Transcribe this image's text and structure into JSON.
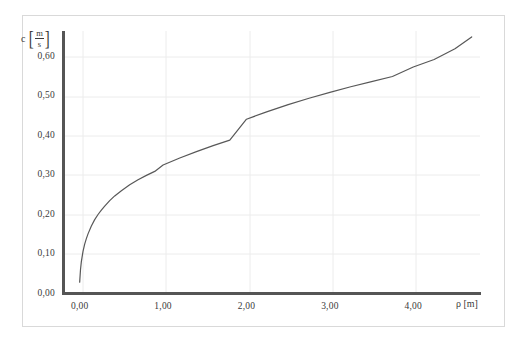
{
  "chart_data": {
    "type": "line",
    "title": "",
    "subtitle": "",
    "xlabel": "ρ [m]",
    "ylabel": "c [m/s]",
    "xlabel_symbol": "ρ",
    "xlabel_unit": "[m]",
    "ylabel_symbol": "c",
    "ylabel_unit_numerator": "m",
    "ylabel_unit_denominator": "s",
    "xlim": [
      -0.2,
      4.8
    ],
    "ylim": [
      0.0,
      0.665
    ],
    "xticks": [
      0,
      1,
      2,
      3,
      4
    ],
    "yticks": [
      0.0,
      0.1,
      0.2,
      0.3,
      0.4,
      0.5,
      0.6
    ],
    "xtick_labels": [
      "0,00",
      "1,00",
      "2,00",
      "3,00",
      "4,00"
    ],
    "ytick_labels": [
      "0,00",
      "0,10",
      "0,20",
      "0,30",
      "0,40",
      "0,50",
      "0,60"
    ],
    "grid": true,
    "grid_color": "#ececec",
    "legend": null,
    "legend_position": "none",
    "series": [
      {
        "name": "c(ρ)",
        "color": "#585858",
        "line_width": 1.2,
        "x": [
          0.0,
          0.01,
          0.02,
          0.04,
          0.06,
          0.08,
          0.1,
          0.14,
          0.18,
          0.22,
          0.26,
          0.3,
          0.36,
          0.42,
          0.5,
          0.6,
          0.7,
          0.8,
          0.9,
          1.0,
          1.2,
          1.4,
          1.6,
          1.8,
          2.0,
          2.25,
          2.5,
          2.75,
          3.0,
          3.25,
          3.5,
          3.75,
          4.0,
          4.25,
          4.5,
          4.7
        ],
        "y": [
          0.03,
          0.062,
          0.082,
          0.108,
          0.126,
          0.14,
          0.152,
          0.172,
          0.188,
          0.201,
          0.212,
          0.222,
          0.236,
          0.248,
          0.261,
          0.276,
          0.289,
          0.3,
          0.31,
          0.326,
          0.344,
          0.36,
          0.375,
          0.389,
          0.442,
          0.461,
          0.479,
          0.495,
          0.51,
          0.524,
          0.537,
          0.55,
          0.574,
          0.593,
          0.62,
          0.65
        ]
      }
    ]
  },
  "axes": {
    "y_title_symbol": "c",
    "y_unit_num": "m",
    "y_unit_den": "s",
    "bracket_left": "[",
    "bracket_right": "]",
    "x_title": "ρ [m]"
  },
  "colors": {
    "curve": "#585858",
    "spine": "#555555",
    "grid": "#ececec",
    "frame": "#d9d9d9",
    "text": "#3a3a3a"
  }
}
